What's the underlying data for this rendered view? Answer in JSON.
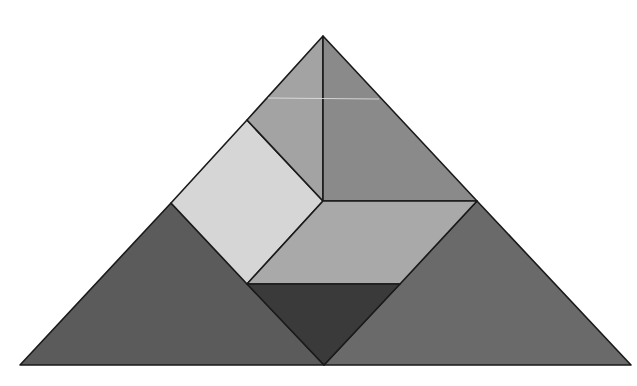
{
  "background": "#ffffff",
  "outline_color": "#1a1a1a",
  "pieces": [
    {
      "id": "large-triangle-left",
      "shape": "large triangle",
      "color": "#5b5b5b"
    },
    {
      "id": "large-triangle-right",
      "shape": "large triangle",
      "color": "#6a6a6a"
    },
    {
      "id": "square",
      "shape": "square",
      "color": "#d6d6d6"
    },
    {
      "id": "small-triangle-top",
      "shape": "small triangle",
      "color": "#a3a3a3"
    },
    {
      "id": "medium-triangle",
      "shape": "medium triangle",
      "color": "#8a8a8a"
    },
    {
      "id": "parallelogram",
      "shape": "parallelogram",
      "color": "#a9a9a9"
    },
    {
      "id": "small-triangle-bottom",
      "shape": "small triangle",
      "color": "#3a3a3a"
    }
  ]
}
